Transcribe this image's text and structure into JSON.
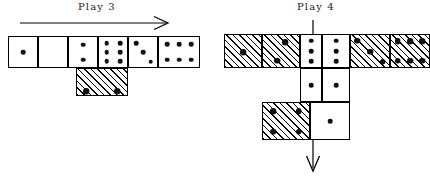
{
  "figure": {
    "type": "domino-layout-diagram",
    "background_color": "#ffffff",
    "ink_color": "#000000"
  },
  "panels": [
    {
      "id": "play3",
      "caption": "Play 3",
      "caption_x": 78,
      "caption_y": 2,
      "arrow": {
        "name": "direction-arrow-right",
        "direction": "right",
        "x": 20,
        "y": 18,
        "length": 148,
        "thickness": 1.2
      },
      "tiles": [
        {
          "name": "tile-1-blank",
          "orientation": "horizontal",
          "x": 8,
          "y": 36,
          "half_w": 30,
          "half_h": 32,
          "halves": [
            {
              "pips": 1,
              "shaded": false
            },
            {
              "pips": 0,
              "shaded": false
            }
          ]
        },
        {
          "name": "tile-2-3",
          "orientation": "horizontal",
          "x": 68,
          "y": 36,
          "half_w": 30,
          "half_h": 32,
          "halves": [
            {
              "pips": 2,
              "shaded": false
            },
            {
              "pips": 3,
              "shaded": false
            }
          ]
        },
        {
          "name": "tile-3-3-spinner",
          "orientation": "horizontal",
          "x": 128,
          "y": 36,
          "half_w": 30,
          "half_h": 32,
          "halves": [
            {
              "pips": 3,
              "shaded": false
            },
            {
              "pips": 3,
              "shaded": false
            }
          ]
        },
        {
          "name": "tile-6-branch",
          "orientation": "horizontal",
          "x": 158,
          "y": 36,
          "half_w": 30,
          "half_h": 32,
          "halves": [
            {
              "pips": 6,
              "shaded": false
            }
          ]
        },
        {
          "name": "tile-new-shaded-vertical",
          "orientation": "vertical",
          "x": 76,
          "y": 68,
          "half_w": 38,
          "half_h": 26,
          "halves": [
            {
              "pips": 0,
              "shaded": true
            },
            {
              "pips": 4,
              "shaded": true
            }
          ]
        }
      ]
    },
    {
      "id": "play4",
      "caption": "Play 4",
      "caption_x": 298,
      "caption_y": 2,
      "arrow": {
        "name": "direction-arrow-down",
        "direction": "down",
        "x": 312,
        "y": 22,
        "length": 152,
        "thickness": 1.2
      },
      "tiles": [
        {
          "name": "tile-1-blank-shaded",
          "orientation": "horizontal",
          "x": 224,
          "y": 34,
          "half_w": 30,
          "half_h": 34,
          "halves": [
            {
              "pips": 1,
              "shaded": true
            },
            {
              "pips": 0,
              "shaded": true
            }
          ]
        },
        {
          "name": "tile-2-3-shaded",
          "orientation": "horizontal",
          "x": 262,
          "y": 34,
          "half_w": 30,
          "half_h": 34,
          "halves": [
            {
              "pips": 2,
              "shaded": true
            },
            {
              "pips": 3,
              "shaded": false
            }
          ]
        },
        {
          "name": "tile-3-3-spinner-center",
          "orientation": "horizontal",
          "x": 292,
          "y": 34,
          "half_w": 30,
          "half_h": 34,
          "halves": [
            {
              "pips": 3,
              "shaded": false
            },
            {
              "pips": 3,
              "shaded": false
            }
          ]
        },
        {
          "name": "tile-3-6-shaded",
          "orientation": "horizontal",
          "x": 352,
          "y": 34,
          "half_w": 30,
          "half_h": 34,
          "halves": [
            {
              "pips": 3,
              "shaded": true
            },
            {
              "pips": 6,
              "shaded": true
            }
          ]
        },
        {
          "name": "tile-2-2-vertical",
          "orientation": "vertical-2col",
          "x": 292,
          "y": 68,
          "half_w": 30,
          "half_h": 34,
          "halves": [
            {
              "pips": 1,
              "shaded": false
            },
            {
              "pips": 1,
              "shaded": false
            }
          ]
        },
        {
          "name": "tile-4-shaded-lower",
          "orientation": "horizontal",
          "x": 262,
          "y": 102,
          "half_w": 30,
          "half_h": 34,
          "halves": [
            {
              "pips": 4,
              "shaded": true
            },
            {
              "pips": 1,
              "shaded": false
            }
          ]
        }
      ]
    }
  ],
  "legend": {
    "shaded_meaning": "hatched = newly played tile",
    "plain_meaning": "plain = previously played tile"
  }
}
